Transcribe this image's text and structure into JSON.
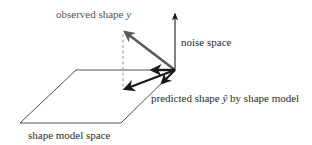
{
  "diagram": {
    "title": "",
    "labels": {
      "observed": {
        "text": "observed shape ",
        "symbol": "y"
      },
      "noise": {
        "text": "noise space"
      },
      "predicted": {
        "prefix": "predicted shape ",
        "symbol": "ŷ",
        "suffix": " by shape model"
      },
      "model_space": {
        "text": "shape model space"
      }
    },
    "nodes": [
      {
        "id": "origin",
        "label": ""
      },
      {
        "id": "observed",
        "label": "observed shape y"
      },
      {
        "id": "predicted",
        "label": "predicted shape ŷ by shape model"
      }
    ],
    "edges": [
      {
        "from": "origin",
        "to": "noise-axis",
        "label": "noise space",
        "style": "arrow"
      },
      {
        "from": "origin",
        "to": "observed",
        "label": "observed shape y",
        "style": "thick-gray-arrow"
      },
      {
        "from": "origin",
        "to": "predicted",
        "label": "predicted shape ŷ",
        "style": "thick-black-arrow"
      },
      {
        "from": "observed",
        "to": "predicted",
        "label": "",
        "style": "dashed-projection"
      }
    ],
    "regions": [
      {
        "id": "shape-model-space",
        "shape": "parallelogram",
        "label": "shape model space"
      }
    ],
    "colors": {
      "observed_vector": "#6b6b6b",
      "predicted_vector": "#1a1a1a",
      "axis": "#2a2a2a",
      "plane": "#3a3a3a",
      "dashed": "#8a8a8a",
      "text": "#2a2a2a"
    }
  }
}
